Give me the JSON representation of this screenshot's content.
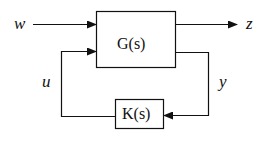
{
  "diagram": {
    "blocks": [
      {
        "id": "G",
        "label": "G(s)"
      },
      {
        "id": "K",
        "label": "K(s)"
      }
    ],
    "signals": {
      "w": "w",
      "z": "z",
      "u": "u",
      "y": "y"
    },
    "edges": [
      {
        "from": "w",
        "to": "G"
      },
      {
        "from": "G",
        "to": "z"
      },
      {
        "from": "G",
        "to": "K",
        "label": "y"
      },
      {
        "from": "K",
        "to": "G",
        "label": "u"
      }
    ],
    "colors": {
      "line": "#111111",
      "background": "#ffffff"
    }
  }
}
